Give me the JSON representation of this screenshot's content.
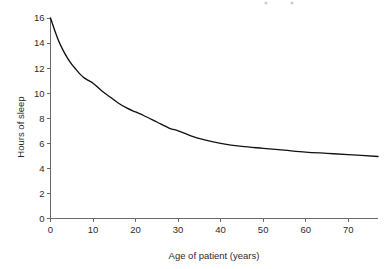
{
  "chart_data": {
    "type": "line",
    "title": "",
    "xlabel": "Age of patient (years)",
    "ylabel": "Hours of sleep",
    "xlim": [
      0,
      77
    ],
    "ylim": [
      0,
      16
    ],
    "grid": false,
    "legend": "none",
    "xticks": [
      0,
      10,
      20,
      30,
      40,
      50,
      60,
      70
    ],
    "xticklabels": [
      "0",
      "10",
      "20",
      "30",
      "40",
      "50",
      "60",
      "70"
    ],
    "yticks": [
      0,
      2,
      4,
      6,
      8,
      10,
      12,
      14,
      16
    ],
    "yticklabels": [
      "0",
      "2",
      "4",
      "6",
      "8",
      "10",
      "12",
      "14",
      "16"
    ],
    "series": [
      {
        "name": "Hours of sleep",
        "color": "#111111",
        "x": [
          0,
          1,
          2,
          3,
          4,
          5,
          6,
          7,
          8,
          9,
          10,
          12,
          14,
          16,
          18,
          20,
          22,
          25,
          28,
          30,
          33,
          36,
          40,
          45,
          50,
          55,
          60,
          65,
          70,
          77
        ],
        "y": [
          16.0,
          15.0,
          14.1,
          13.4,
          12.8,
          12.3,
          11.9,
          11.5,
          11.2,
          11.0,
          10.8,
          10.2,
          9.7,
          9.2,
          8.8,
          8.5,
          8.2,
          7.7,
          7.2,
          7.0,
          6.6,
          6.3,
          6.0,
          5.75,
          5.6,
          5.45,
          5.3,
          5.2,
          5.1,
          4.95
        ]
      }
    ]
  },
  "axes": {
    "x_axis_name": "x-axis",
    "y_axis_name": "y-axis"
  }
}
